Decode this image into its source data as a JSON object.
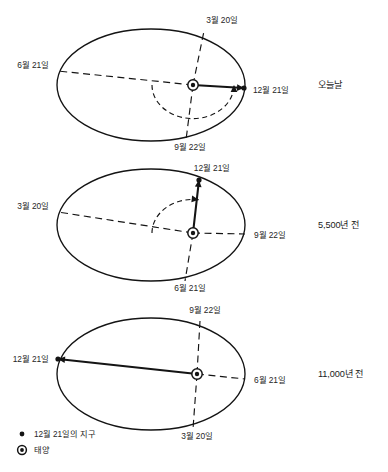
{
  "figure": {
    "title_visible": false,
    "background_color": "#ffffff",
    "ink_color": "#141414"
  },
  "chart_data": {
    "type": "diagram",
    "title": "",
    "subtitle": "",
    "legend_position": "bottom-left",
    "panels": [
      {
        "id": "panel-today",
        "era_label": "오늘날",
        "ellipse": {
          "cx": 151,
          "cy": 85,
          "rx": 94,
          "ry": 56
        },
        "sun": {
          "x": 193,
          "y": 85
        },
        "earth_dec21": {
          "x": 244,
          "y": 88
        },
        "arc_start_angle_deg": 180,
        "arc_end_angle_deg": 0,
        "arc_radius": 41,
        "points": [
          {
            "date": "3월 20일",
            "position": "top",
            "x": 204,
            "y": 31,
            "label_x": 222,
            "label_y": 23,
            "anchor": "middle",
            "line": "dashed"
          },
          {
            "date": "6월 21일",
            "position": "left",
            "x": 58,
            "y": 71,
            "label_x": 49,
            "label_y": 68,
            "anchor": "end",
            "line": "dashed"
          },
          {
            "date": "12월 21일",
            "position": "right",
            "x": 244,
            "y": 88,
            "label_x": 253,
            "label_y": 93,
            "anchor": "start",
            "line": "solid"
          },
          {
            "date": "9월 22일",
            "position": "bottom",
            "x": 186,
            "y": 140,
            "label_x": 190,
            "label_y": 150,
            "anchor": "middle",
            "line": "dashed"
          }
        ]
      },
      {
        "id": "panel-5500",
        "era_label": "5,500년 전",
        "ellipse": {
          "cx": 151,
          "cy": 225,
          "rx": 94,
          "ry": 56
        },
        "sun": {
          "x": 193,
          "y": 233
        },
        "earth_dec21": {
          "x": 199,
          "y": 180
        },
        "arc_start_angle_deg": 180,
        "arc_end_angle_deg": 278,
        "arc_radius": 41,
        "points": [
          {
            "date": "12월 21일",
            "position": "top",
            "x": 199,
            "y": 180,
            "label_x": 212,
            "label_y": 171,
            "anchor": "middle",
            "line": "solid"
          },
          {
            "date": "3월 20일",
            "position": "left",
            "x": 58,
            "y": 212,
            "label_x": 49,
            "label_y": 209,
            "anchor": "end",
            "line": "dashed"
          },
          {
            "date": "9월 22일",
            "position": "right",
            "x": 245,
            "y": 234,
            "label_x": 254,
            "label_y": 238,
            "anchor": "start",
            "line": "dashed"
          },
          {
            "date": "6월 21일",
            "position": "bottom",
            "x": 185,
            "y": 281,
            "label_x": 190,
            "label_y": 291,
            "anchor": "middle",
            "line": "dashed"
          }
        ]
      },
      {
        "id": "panel-11000",
        "era_label": "11,000년 전",
        "ellipse": {
          "cx": 151,
          "cy": 374,
          "rx": 94,
          "ry": 56
        },
        "sun": {
          "x": 197,
          "y": 374
        },
        "earth_dec21": {
          "x": 58,
          "y": 359
        },
        "arc_start_angle_deg": null,
        "arc_end_angle_deg": null,
        "arc_radius": null,
        "points": [
          {
            "date": "9월 22일",
            "position": "top",
            "x": 200,
            "y": 321,
            "label_x": 205,
            "label_y": 313,
            "anchor": "middle",
            "line": "dashed"
          },
          {
            "date": "12월 21일",
            "position": "left",
            "x": 58,
            "y": 359,
            "label_x": 49,
            "label_y": 362,
            "anchor": "end",
            "line": "solid"
          },
          {
            "date": "6월 21일",
            "position": "right",
            "x": 245,
            "y": 379,
            "label_x": 254,
            "label_y": 383,
            "anchor": "start",
            "line": "dashed"
          },
          {
            "date": "3월 20일",
            "position": "bottom",
            "x": 193,
            "y": 429,
            "label_x": 197,
            "label_y": 439,
            "anchor": "middle",
            "line": "dashed"
          }
        ]
      }
    ],
    "legend": [
      {
        "marker": "filled-dot",
        "label": "12월 21일의 지구",
        "x": 22,
        "y": 437
      },
      {
        "marker": "sun-circle-dot",
        "label": "태양",
        "x": 22,
        "y": 453
      }
    ]
  }
}
